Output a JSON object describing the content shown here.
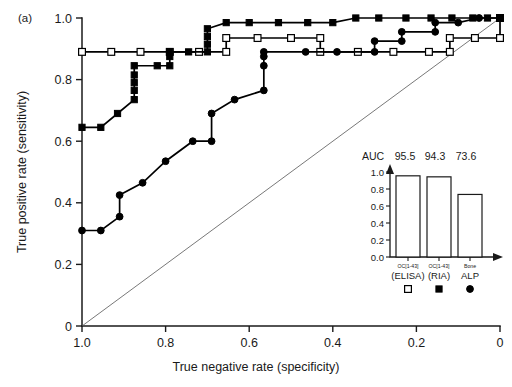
{
  "figure": {
    "panel_label": "(a)"
  },
  "chart_data": {
    "type": "line",
    "title": "",
    "xlabel": "True negative rate (specificity)",
    "ylabel": "True positive rate (sensitivity)",
    "xlim": [
      1.0,
      0.0
    ],
    "ylim": [
      0.0,
      1.0
    ],
    "x_reversed": true,
    "grid": false,
    "xticks": [
      "1.0",
      "0.8",
      "0.6",
      "0.4",
      "0.2",
      "0"
    ],
    "xtick_values": [
      1.0,
      0.8,
      0.6,
      0.4,
      0.2,
      0.0
    ],
    "yticks": [
      "0",
      "0.2",
      "0.4",
      "0.6",
      "0.8",
      "1.0"
    ],
    "ytick_values": [
      0.0,
      0.2,
      0.4,
      0.6,
      0.8,
      1.0
    ],
    "reference_line": {
      "label": "chance diagonal",
      "from": [
        1.0,
        0.0
      ],
      "to": [
        0.0,
        1.0
      ]
    },
    "legend_position": "inset-bottom-right",
    "series": [
      {
        "name": "OC[1-43] (ELISA)",
        "marker": "square-open",
        "auc": 95.5,
        "points": [
          [
            1.0,
            0.89
          ],
          [
            0.93,
            0.89
          ],
          [
            0.86,
            0.89
          ],
          [
            0.79,
            0.89
          ],
          [
            0.72,
            0.89
          ],
          [
            0.655,
            0.89
          ],
          [
            0.655,
            0.935
          ],
          [
            0.58,
            0.935
          ],
          [
            0.5,
            0.935
          ],
          [
            0.43,
            0.935
          ],
          [
            0.43,
            0.89
          ],
          [
            0.34,
            0.89
          ],
          [
            0.255,
            0.89
          ],
          [
            0.17,
            0.89
          ],
          [
            0.12,
            0.89
          ],
          [
            0.12,
            0.935
          ],
          [
            0.06,
            0.935
          ],
          [
            0.0,
            0.935
          ],
          [
            0.0,
            1.0
          ]
        ]
      },
      {
        "name": "OC[1-43] (RIA)",
        "marker": "square-filled",
        "auc": 94.3,
        "points": [
          [
            1.0,
            0.645
          ],
          [
            0.955,
            0.645
          ],
          [
            0.915,
            0.69
          ],
          [
            0.875,
            0.735
          ],
          [
            0.875,
            0.765
          ],
          [
            0.875,
            0.79
          ],
          [
            0.875,
            0.815
          ],
          [
            0.875,
            0.845
          ],
          [
            0.82,
            0.845
          ],
          [
            0.79,
            0.845
          ],
          [
            0.79,
            0.875
          ],
          [
            0.79,
            0.89
          ],
          [
            0.745,
            0.89
          ],
          [
            0.7,
            0.89
          ],
          [
            0.7,
            0.915
          ],
          [
            0.7,
            0.94
          ],
          [
            0.7,
            0.965
          ],
          [
            0.655,
            0.985
          ],
          [
            0.6,
            0.985
          ],
          [
            0.53,
            0.985
          ],
          [
            0.46,
            0.985
          ],
          [
            0.4,
            0.985
          ],
          [
            0.345,
            1.0
          ],
          [
            0.29,
            1.0
          ],
          [
            0.225,
            1.0
          ],
          [
            0.165,
            1.0
          ],
          [
            0.115,
            1.0
          ],
          [
            0.065,
            1.0
          ],
          [
            0.03,
            1.0
          ],
          [
            0.0,
            1.0
          ]
        ]
      },
      {
        "name": "Bone ALP",
        "marker": "circle-filled",
        "auc": 73.6,
        "points": [
          [
            1.0,
            0.31
          ],
          [
            0.955,
            0.31
          ],
          [
            0.91,
            0.355
          ],
          [
            0.91,
            0.425
          ],
          [
            0.855,
            0.465
          ],
          [
            0.8,
            0.535
          ],
          [
            0.735,
            0.6
          ],
          [
            0.69,
            0.6
          ],
          [
            0.69,
            0.69
          ],
          [
            0.635,
            0.735
          ],
          [
            0.565,
            0.765
          ],
          [
            0.565,
            0.845
          ],
          [
            0.565,
            0.875
          ],
          [
            0.565,
            0.89
          ],
          [
            0.465,
            0.89
          ],
          [
            0.39,
            0.89
          ],
          [
            0.3,
            0.89
          ],
          [
            0.3,
            0.925
          ],
          [
            0.235,
            0.925
          ],
          [
            0.235,
            0.955
          ],
          [
            0.155,
            0.955
          ],
          [
            0.155,
            0.985
          ],
          [
            0.1,
            0.985
          ],
          [
            0.05,
            1.0
          ],
          [
            0.0,
            1.0
          ]
        ]
      }
    ]
  },
  "inset": {
    "type": "bar",
    "header_label": "AUC",
    "auc_values": [
      "95.5",
      "94.3",
      "73.6"
    ],
    "ylim": [
      0.0,
      1.0
    ],
    "yticks": [
      "1.0",
      "0.8",
      "0.6",
      "0.4",
      "0.2",
      "0.0"
    ],
    "ytick_values": [
      1.0,
      0.8,
      0.6,
      0.4,
      0.2,
      0.0
    ],
    "bar_values": [
      0.955,
      0.943,
      0.736
    ],
    "categories": [
      {
        "top": "OC[1-43]",
        "bottom": "(ELISA)",
        "marker": "square-open"
      },
      {
        "top": "OC[1-43]",
        "bottom": "(RIA)",
        "marker": "square-filled"
      },
      {
        "top": "Bone",
        "bottom": "ALP",
        "marker": "circle-filled"
      }
    ]
  }
}
